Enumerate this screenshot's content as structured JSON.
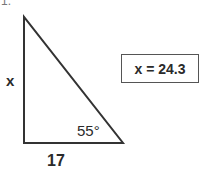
{
  "problem": {
    "number": "1.",
    "triangle": {
      "type": "right-triangle",
      "side_labels": {
        "vertical_leg": "x",
        "horizontal_leg": "17"
      },
      "angle_label": "55°"
    },
    "answer": "x = 24.3"
  }
}
